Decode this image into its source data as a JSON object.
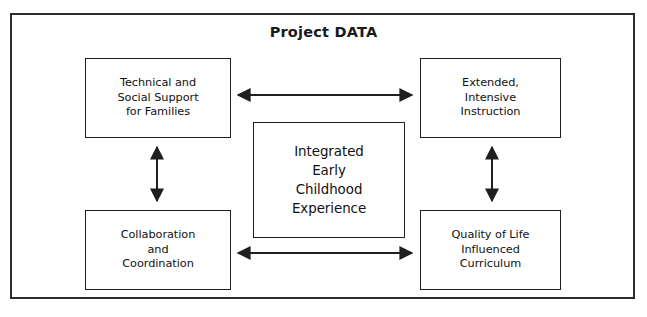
{
  "diagram": {
    "title": "Project DATA",
    "frame": {
      "name": "outer-frame"
    },
    "nodes": [
      {
        "id": "tech",
        "label": "Technical and\nSocial Support\nfor Families",
        "position": "top-left"
      },
      {
        "id": "ext",
        "label": "Extended,\nIntensive\nInstruction",
        "position": "top-right"
      },
      {
        "id": "center",
        "label": "Integrated\nEarly\nChildhood\nExperience",
        "position": "center"
      },
      {
        "id": "collab",
        "label": "Collaboration\nand\nCoordination",
        "position": "bottom-left"
      },
      {
        "id": "qol",
        "label": "Quality of Life\nInfluenced\nCurriculum",
        "position": "bottom-right"
      }
    ],
    "connectors": [
      {
        "id": "tech-ext",
        "from": "tech",
        "to": "ext",
        "style": "double-headed",
        "orientation": "horizontal"
      },
      {
        "id": "tech-collab",
        "from": "tech",
        "to": "collab",
        "style": "double-headed",
        "orientation": "vertical"
      },
      {
        "id": "ext-qol",
        "from": "ext",
        "to": "qol",
        "style": "double-headed",
        "orientation": "vertical"
      },
      {
        "id": "collab-qol",
        "from": "collab",
        "to": "qol",
        "style": "double-headed",
        "orientation": "horizontal"
      }
    ],
    "colors": {
      "line": "#1f1f1f",
      "frame": "#2b2b2b",
      "text": "#111111",
      "background": "#ffffff"
    }
  }
}
